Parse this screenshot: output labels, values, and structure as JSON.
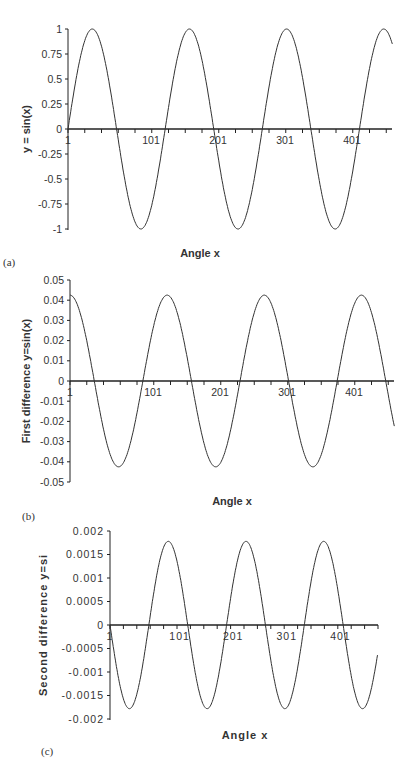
{
  "chart_data": [
    {
      "type": "line",
      "panel": "(a)",
      "title": "",
      "xlabel": "Angle x",
      "ylabel": "y = sin(x)",
      "xlim": [
        1,
        485
      ],
      "ylim": [
        -1,
        1
      ],
      "x_tick_labels": [
        "1",
        "101",
        "201",
        "301",
        "401"
      ],
      "x_minor_tick_step": 25,
      "y_ticks": [
        1,
        0.75,
        0.5,
        0.25,
        0,
        -0.25,
        -0.5,
        -0.75,
        -1
      ],
      "y_tick_labels": [
        "1",
        "0.75",
        "0.5",
        "0.25",
        "0",
        "-0.25",
        "-0.5",
        "-0.75",
        "-1"
      ],
      "grid": false,
      "legend": null,
      "series": [
        {
          "name": "y = sin(x)",
          "function": "sin",
          "amplitude": 1,
          "period_points": 145,
          "phase": 0
        }
      ],
      "x": [
        1,
        37,
        73,
        109,
        145,
        181,
        218,
        254,
        290,
        326,
        363,
        399,
        435,
        471,
        485
      ],
      "values": [
        0,
        1,
        0,
        -1,
        0,
        1,
        0,
        -1,
        0,
        1,
        0,
        -1,
        0,
        1,
        0.91
      ]
    },
    {
      "type": "line",
      "panel": "(b)",
      "title": "",
      "xlabel": "Angle x",
      "ylabel": "First difference y=sin(x)",
      "xlim": [
        1,
        485
      ],
      "ylim": [
        -0.05,
        0.05
      ],
      "x_tick_labels": [
        "1",
        "101",
        "201",
        "301",
        "401"
      ],
      "x_minor_tick_step": 25,
      "y_ticks": [
        0.05,
        0.04,
        0.03,
        0.02,
        0.01,
        0,
        -0.01,
        -0.02,
        -0.03,
        -0.04,
        -0.05
      ],
      "y_tick_labels": [
        "0.05",
        "0.04",
        "0.03",
        "0.02",
        "0.01",
        "0",
        "-0.01",
        "-0.02",
        "-0.03",
        "-0.04",
        "-0.05"
      ],
      "grid": false,
      "legend": null,
      "series": [
        {
          "name": "First difference",
          "function": "cos",
          "amplitude": 0.0425,
          "period_points": 145,
          "phase": 0
        }
      ],
      "x": [
        1,
        37,
        73,
        109,
        145,
        181,
        218,
        254,
        290,
        326,
        363,
        399,
        435,
        471,
        485
      ],
      "values": [
        0.042,
        0,
        -0.042,
        0,
        0.042,
        0,
        -0.042,
        0,
        0.042,
        0,
        -0.042,
        0,
        0.042,
        0,
        -0.017
      ]
    },
    {
      "type": "line",
      "panel": "(c)",
      "title": "",
      "xlabel": "Angle x",
      "ylabel": "Second difference y=si",
      "xlim": [
        1,
        500
      ],
      "ylim": [
        -0.002,
        0.002
      ],
      "x_tick_labels": [
        "1",
        "101",
        "201",
        "301",
        "401"
      ],
      "x_minor_tick_step": 25,
      "y_ticks": [
        0.002,
        0.0015,
        0.001,
        0.0005,
        0,
        -0.0005,
        -0.001,
        -0.0015,
        -0.002
      ],
      "y_tick_labels": [
        "0.002",
        "0.0015",
        "0.001",
        "0.0005",
        "0",
        "-0.0005",
        "-0.001",
        "-0.0015",
        "-0.002"
      ],
      "grid": false,
      "legend": null,
      "series": [
        {
          "name": "Second difference",
          "function": "-sin",
          "amplitude": 0.00178,
          "period_points": 145,
          "phase": 0
        }
      ],
      "x": [
        1,
        37,
        73,
        109,
        145,
        181,
        218,
        254,
        290,
        326,
        363,
        399,
        435,
        471,
        500
      ],
      "values": [
        0,
        -0.00178,
        0,
        0.00178,
        0,
        -0.00178,
        0,
        0.00178,
        0,
        -0.00178,
        0,
        0.00178,
        0,
        -0.00178,
        -0.0016
      ]
    }
  ],
  "panels": {
    "a": {
      "label": "(a)",
      "xlabel": "Angle x",
      "ylabel": "y = sin(x)"
    },
    "b": {
      "label": "(b)",
      "xlabel": "Angle x",
      "ylabel": "First difference y=sin(x)"
    },
    "c": {
      "label": "(c)",
      "xlabel": "Angle x",
      "ylabel": "Second difference y=si"
    }
  },
  "colors": {
    "line": "#333333",
    "axis": "#222222",
    "background": "#ffffff"
  }
}
